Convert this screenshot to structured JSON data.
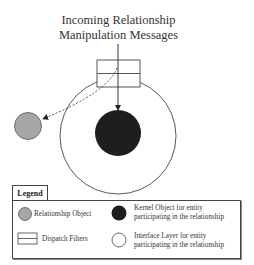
{
  "diagram": {
    "title_lines": [
      "Incoming Relationship",
      "Manipulation Messages"
    ],
    "elements": {
      "dispatch_filter": {
        "type": "rectangle",
        "rows": 2,
        "label": "Dispatch Filters"
      },
      "interface_layer": {
        "type": "circle",
        "fill": "#ffffff",
        "label": "Interface Layer for entity participating in the relationship"
      },
      "kernel_object": {
        "type": "circle",
        "fill": "#1e1e1e",
        "label": "Kernel Object for entity participating in the relationship"
      },
      "relationship_object": {
        "type": "circle",
        "fill": "#a6a6a6",
        "label": "Relationship Object"
      }
    },
    "arrows": [
      {
        "from": "incoming-messages",
        "to": "kernel_object",
        "style": "solid"
      },
      {
        "from": "dispatch_filter",
        "to": "relationship_object",
        "style": "dashed"
      }
    ]
  },
  "legend": {
    "title": "Legend",
    "items": [
      {
        "icon": "gray-circle",
        "label": "Relationship Object"
      },
      {
        "icon": "dispatch-filter-rect",
        "label": "Dispatch Filters"
      },
      {
        "icon": "black-circle",
        "label_lines": [
          "Kernel Object for entity",
          "participating in the relationship"
        ]
      },
      {
        "icon": "white-circle",
        "label_lines": [
          "Interface Layer for entity",
          "participating in the relationship"
        ]
      }
    ]
  },
  "colors": {
    "kernel": "#1e1e1e",
    "relationship": "#a6a6a6",
    "stroke": "#444444"
  }
}
